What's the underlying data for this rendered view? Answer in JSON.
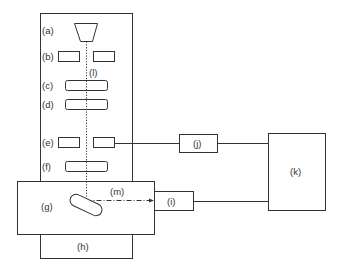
{
  "diagram": {
    "colors": {
      "stroke": "#333333",
      "background": "#ffffff"
    },
    "labels": {
      "a": "(a)",
      "b": "(b)",
      "c": "(c)",
      "d": "(d)",
      "e": "(e)",
      "f": "(f)",
      "g": "(g)",
      "h": "(h)",
      "i": "(i)",
      "j": "(j)",
      "k": "(k)",
      "l": "(l)",
      "m": "(m)"
    }
  }
}
